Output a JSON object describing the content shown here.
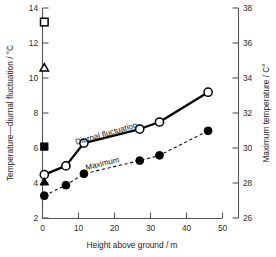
{
  "chart_data": {
    "type": "line",
    "title": "",
    "xlabel": "Height above ground / m",
    "ylabel": "Temperature—diurnal fluctuation / °C",
    "y2label": "Maximum temperature / C°",
    "xlim": [
      0,
      50
    ],
    "ylim": [
      2,
      14
    ],
    "y2lim": [
      26,
      38
    ],
    "grid": false,
    "legend": "inline-annotations",
    "xticks": [
      0,
      10,
      20,
      30,
      40,
      50
    ],
    "xtick_labels": [
      "0",
      "10",
      "20",
      "30",
      "40",
      "50"
    ],
    "yticks": [
      2,
      4,
      6,
      8,
      10,
      12,
      14
    ],
    "ytick_labels": [
      "2",
      "4",
      "6",
      "8",
      "10",
      "12",
      "14"
    ],
    "y2ticks": [
      26,
      28,
      30,
      32,
      34,
      36,
      38
    ],
    "y2tick_labels": [
      "26",
      "28",
      "30",
      "32",
      "34",
      "36",
      "38"
    ],
    "series": [
      {
        "name": "Diurnal fluctuation",
        "marker": "open-circle",
        "linestyle": "solid",
        "axis": "left",
        "x": [
          0.5,
          6.5,
          11.5,
          27.0,
          32.5,
          46.0
        ],
        "values": [
          4.5,
          5.0,
          6.3,
          7.1,
          7.5,
          9.2
        ]
      },
      {
        "name": "Maximum",
        "marker": "filled-circle",
        "linestyle": "dashed",
        "axis": "right",
        "x": [
          0.5,
          6.5,
          11.5,
          27.0,
          32.5,
          46.0
        ],
        "values": [
          3.3,
          3.9,
          4.55,
          5.3,
          5.6,
          7.0
        ]
      }
    ],
    "isolated_points": [
      {
        "marker": "open-square",
        "x": 0.5,
        "y": 13.2
      },
      {
        "marker": "open-triangle",
        "x": 0.5,
        "y": 10.6
      },
      {
        "marker": "filled-square",
        "x": 0.5,
        "y": 6.1
      },
      {
        "marker": "filled-triangle",
        "x": 0.5,
        "y": 4.1
      }
    ],
    "annotations": [
      {
        "text": "Diurnal fluctuation",
        "x": 18.0,
        "y": 7.05,
        "rotation": -16
      },
      {
        "text": "Maximum",
        "x": 17.0,
        "y": 5.35,
        "rotation": -14
      }
    ],
    "colors": {
      "line": "#000000",
      "axis": "#555555",
      "text": "#1b1b1b",
      "background": "#ffffff"
    }
  }
}
